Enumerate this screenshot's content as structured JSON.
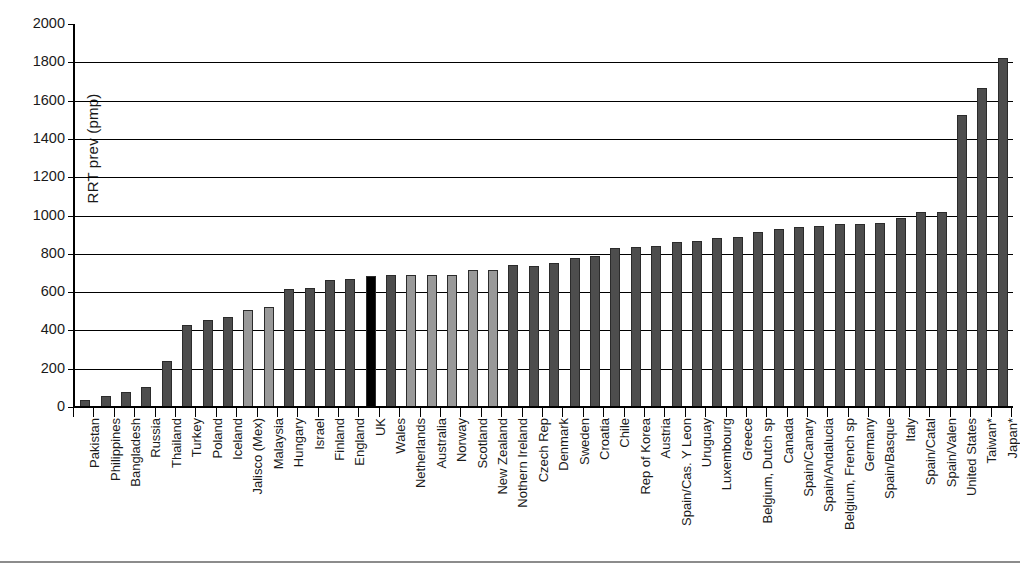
{
  "chart_data": {
    "type": "bar",
    "title": "",
    "xlabel": "",
    "ylabel": "RRT prev (pmp)",
    "ylim": [
      0,
      2000
    ],
    "ytick_step": 200,
    "yticks": [
      0,
      200,
      400,
      600,
      800,
      1000,
      1200,
      1400,
      1600,
      1800,
      2000
    ],
    "grid": "horizontal",
    "legend": "none",
    "note": "* denotes Taiwan and Japan",
    "highlight_category": "UK",
    "highlight_color": "#000000",
    "bar_color_dark": "#4d4d4d",
    "bar_color_light": "#999999",
    "bar_border_color": "#2b2b2b",
    "categories": [
      "Pakistan",
      "Philippines",
      "Bangladesh",
      "Russia",
      "Thailand",
      "Turkey",
      "Poland",
      "Iceland",
      "Jalisco (Mex)",
      "Malaysia",
      "Hungary",
      "Israel",
      "Finland",
      "England",
      "UK",
      "Wales",
      "Netherlands",
      "Australia",
      "Norway",
      "Scotland",
      "New Zealand",
      "Nothern Ireland",
      "Czech Rep",
      "Denmark",
      "Sweden",
      "Croatia",
      "Chile",
      "Rep of Korea",
      "Austria",
      "Spain/Cas. Y Leon",
      "Uruguay",
      "Luxembourg",
      "Greece",
      "Belgium, Dutch sp",
      "Canada",
      "Spain/Canary",
      "Spain/Andalucia",
      "Belgium, French sp",
      "Germany",
      "Spain/Basque",
      "Italy",
      "Spain/Catal",
      "Spain/Valen",
      "United States",
      "Taiwan*",
      "Japan*"
    ],
    "values": [
      35,
      60,
      80,
      105,
      240,
      430,
      455,
      470,
      505,
      520,
      615,
      620,
      665,
      670,
      685,
      690,
      690,
      690,
      690,
      715,
      715,
      740,
      735,
      750,
      780,
      790,
      830,
      835,
      840,
      860,
      865,
      880,
      890,
      915,
      930,
      940,
      945,
      955,
      955,
      960,
      985,
      1020,
      1020,
      1525,
      1665,
      1820
    ],
    "shades": [
      "dark",
      "dark",
      "dark",
      "dark",
      "dark",
      "dark",
      "dark",
      "dark",
      "light",
      "light",
      "dark",
      "dark",
      "dark",
      "dark",
      "black",
      "dark",
      "light",
      "light",
      "light",
      "light",
      "light",
      "dark",
      "dark",
      "dark",
      "dark",
      "dark",
      "dark",
      "dark",
      "dark",
      "dark",
      "dark",
      "dark",
      "dark",
      "dark",
      "dark",
      "dark",
      "dark",
      "dark",
      "dark",
      "dark",
      "dark",
      "dark",
      "dark",
      "dark",
      "dark",
      "dark"
    ]
  }
}
